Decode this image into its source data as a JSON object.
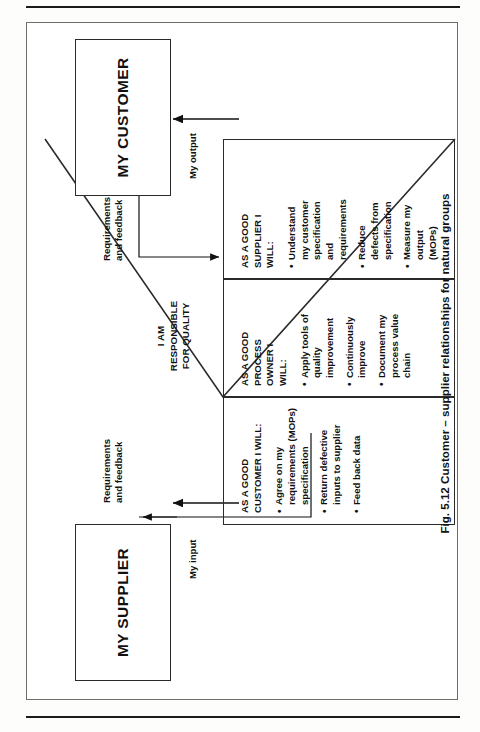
{
  "page": {
    "orientation_note": "figure printed sideways (rotated 90 degrees counter-clockwise)"
  },
  "figure": {
    "caption": "Fig. 5.12  Customer – supplier relationships for natural groups",
    "entities": {
      "supplier_box": "MY SUPPLIER",
      "customer_box": "MY CUSTOMER"
    },
    "center_label": "I AM\nRESPONSIBLE\nFOR QUALITY",
    "flows": {
      "my_input": "My input",
      "my_output": "My output",
      "requirements_left": "Requirements\nand feedback",
      "requirements_right": "Requirements\nand feedback"
    },
    "columns": [
      {
        "id": "good-customer",
        "heading": "AS A GOOD\nCUSTOMER I WILL:",
        "bullets": [
          "Agree on my\nrequirements (MOPs)\nspecification",
          "Return defective\ninputs to supplier",
          "Feed back data"
        ]
      },
      {
        "id": "good-process-owner",
        "heading": "AS A GOOD\nPROCESS\nOWNER I\nWILL:",
        "bullets": [
          "Apply tools of\nquality\nimprovement",
          "Continuously\nimprove",
          "Document my\nprocess value\nchain"
        ]
      },
      {
        "id": "good-supplier",
        "heading": "AS A GOOD\nSUPPLIER I\nWILL:",
        "bullets": [
          "Understand\nmy customer\nspecification\nand\nrequirements",
          "Reduce\ndefects from\nspecification",
          "Measure my\noutput\n(MOPs)"
        ]
      }
    ]
  },
  "colors": {
    "ink": "#111111",
    "line": "#2b2b2b",
    "paper": "#ffffff",
    "rule": "#1b1b1b"
  }
}
